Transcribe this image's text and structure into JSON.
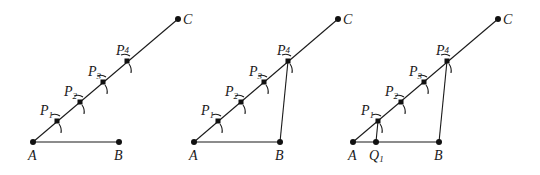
{
  "figure": {
    "colors": {
      "stroke": "#1a1a1a",
      "background": "#ffffff"
    },
    "panels": [
      {
        "id": "panel-1",
        "step": "Mark equal segments P1..P4 on ray AC",
        "points": {
          "A": {
            "label": "A",
            "x": 33,
            "y": 142
          },
          "B": {
            "label": "B",
            "x": 119,
            "y": 142
          },
          "C": {
            "label": "C",
            "x": 178,
            "y": 19
          },
          "P1": {
            "label": "P",
            "sub": "1",
            "x": 57,
            "y": 121
          },
          "P2": {
            "label": "P",
            "sub": "2",
            "x": 80,
            "y": 102
          },
          "P3": {
            "label": "P",
            "sub": "3",
            "x": 103,
            "y": 82
          },
          "P4": {
            "label": "P",
            "sub": "4",
            "x": 127,
            "y": 61
          }
        }
      },
      {
        "id": "panel-2",
        "step": "Join P4 to B",
        "points": {
          "A": {
            "label": "A",
            "x": 194,
            "y": 142
          },
          "B": {
            "label": "B",
            "x": 280,
            "y": 142
          },
          "C": {
            "label": "C",
            "x": 338,
            "y": 19
          },
          "P1": {
            "label": "P",
            "sub": "1",
            "x": 218,
            "y": 121
          },
          "P2": {
            "label": "P",
            "sub": "2",
            "x": 241,
            "y": 102
          },
          "P3": {
            "label": "P",
            "sub": "3",
            "x": 264,
            "y": 82
          },
          "P4": {
            "label": "P",
            "sub": "4",
            "x": 288,
            "y": 61
          }
        }
      },
      {
        "id": "panel-3",
        "step": "Draw parallel through P1 to meet AB at Q1",
        "points": {
          "A": {
            "label": "A",
            "x": 353,
            "y": 142
          },
          "Q1": {
            "label": "Q",
            "sub": "1",
            "x": 376,
            "y": 142
          },
          "B": {
            "label": "B",
            "x": 439,
            "y": 142
          },
          "C": {
            "label": "C",
            "x": 498,
            "y": 19
          },
          "P1": {
            "label": "P",
            "sub": "1",
            "x": 378,
            "y": 121
          },
          "P2": {
            "label": "P",
            "sub": "2",
            "x": 401,
            "y": 102
          },
          "P3": {
            "label": "P",
            "sub": "3",
            "x": 424,
            "y": 82
          },
          "P4": {
            "label": "P",
            "sub": "4",
            "x": 447,
            "y": 61
          }
        }
      }
    ]
  }
}
